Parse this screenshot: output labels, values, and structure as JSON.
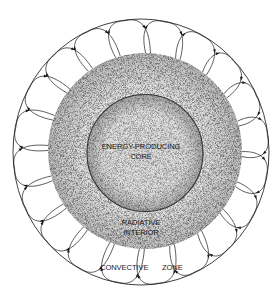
{
  "figure": {
    "labels": {
      "core_line1": "ENERGY-PRODUCING",
      "core_line2": "CORE",
      "radiative_line1": "RADIATIVE",
      "radiative_line2": "INTERIOR",
      "convective_word1": "CONVECTIVE",
      "convective_word2": "ZONE"
    },
    "layers": [
      {
        "name": "energy-producing core",
        "center": [
          145,
          153
        ],
        "rx": 58,
        "ry": 58,
        "fill": "#d9d9d9",
        "style": "stippled"
      },
      {
        "name": "radiative interior",
        "center": [
          145,
          151
        ],
        "rx": 97,
        "ry": 98,
        "fill": "#e4e4e4",
        "style": "stippled"
      },
      {
        "name": "convective zone",
        "center": [
          141,
          152
        ],
        "rx": 128,
        "ry": 133,
        "fill": "#ffffff",
        "style": "convection loops"
      }
    ],
    "convection": {
      "loop_count": 20,
      "arrow_color": "#1a1a1a",
      "line_color": "#2a2a2a"
    }
  }
}
